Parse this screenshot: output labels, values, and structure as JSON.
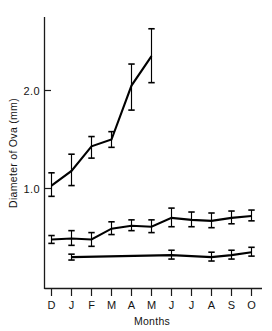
{
  "chart_data": {
    "type": "line",
    "title": "",
    "xlabel": "Months",
    "ylabel": "Diameter of Ova (mm)",
    "categories": [
      "D",
      "J",
      "F",
      "M",
      "A",
      "M",
      "J",
      "J",
      "A",
      "S",
      "O"
    ],
    "yticks": [
      1.0,
      2.0
    ],
    "ytick_labels": [
      "1.0",
      "2.0"
    ],
    "ylim": [
      0.12,
      2.75
    ],
    "grid": false,
    "legend": "none",
    "error_bars": "vertical, capped (mean +/- SD)",
    "series": [
      {
        "name": "series-upper",
        "x": [
          "D",
          "J",
          "F",
          "M",
          "A",
          "M"
        ],
        "values": [
          1.03,
          1.18,
          1.43,
          1.5,
          2.05,
          2.35
        ],
        "err_low": [
          0.92,
          1.03,
          1.31,
          1.42,
          1.8,
          2.08
        ],
        "err_high": [
          1.16,
          1.35,
          1.53,
          1.58,
          2.27,
          2.63
        ]
      },
      {
        "name": "series-middle",
        "x": [
          "D",
          "J",
          "F",
          "M",
          "A",
          "M",
          "J",
          "J",
          "A",
          "S",
          "O"
        ],
        "values": [
          0.48,
          0.49,
          0.48,
          0.59,
          0.62,
          0.61,
          0.7,
          0.68,
          0.67,
          0.7,
          0.72
        ],
        "err_low": [
          0.44,
          0.42,
          0.41,
          0.53,
          0.57,
          0.55,
          0.61,
          0.61,
          0.6,
          0.64,
          0.67
        ],
        "err_high": [
          0.52,
          0.57,
          0.55,
          0.66,
          0.68,
          0.68,
          0.8,
          0.76,
          0.75,
          0.77,
          0.78
        ]
      },
      {
        "name": "series-lower",
        "x": [
          "J",
          "J",
          "A",
          "S",
          "O"
        ],
        "values": [
          0.3,
          0.32,
          0.3,
          0.32,
          0.35
        ],
        "err_low": [
          0.27,
          0.28,
          0.26,
          0.28,
          0.31
        ],
        "err_high": [
          0.33,
          0.37,
          0.35,
          0.37,
          0.4
        ]
      }
    ]
  },
  "axes": {
    "y_axis_label": "Diameter of Ova (mm)",
    "x_axis_label": "Months",
    "y_tick_1": "1.0",
    "y_tick_2": "2.0",
    "x_tick_0": "D",
    "x_tick_1": "J",
    "x_tick_2": "F",
    "x_tick_3": "M",
    "x_tick_4": "A",
    "x_tick_5": "M",
    "x_tick_6": "J",
    "x_tick_7": "J",
    "x_tick_8": "A",
    "x_tick_9": "S",
    "x_tick_10": "O"
  },
  "colors": {
    "line": "#000000",
    "axis": "#1a1a1a",
    "background": "#ffffff",
    "text": "#141414"
  }
}
